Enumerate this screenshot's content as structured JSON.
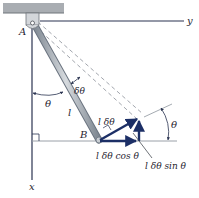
{
  "diagram": {
    "type": "pendulum virtual displacement",
    "labels": {
      "A": "A",
      "B": "B",
      "x_axis": "x",
      "y_axis": "y",
      "theta_left": "θ",
      "delta_theta": "δθ",
      "length": "l",
      "l_delta_theta": "l δθ",
      "cos_component": "l δθ cos θ",
      "sin_component": "l δθ sin θ",
      "theta_right": "θ"
    },
    "colors": {
      "axis": "#2a3350",
      "rod": "#9aa3ad",
      "rod_edge": "#6b7480",
      "ceiling": "#a9adb2",
      "vector": "#1c2f66",
      "dashed": "#8a8f98"
    }
  }
}
